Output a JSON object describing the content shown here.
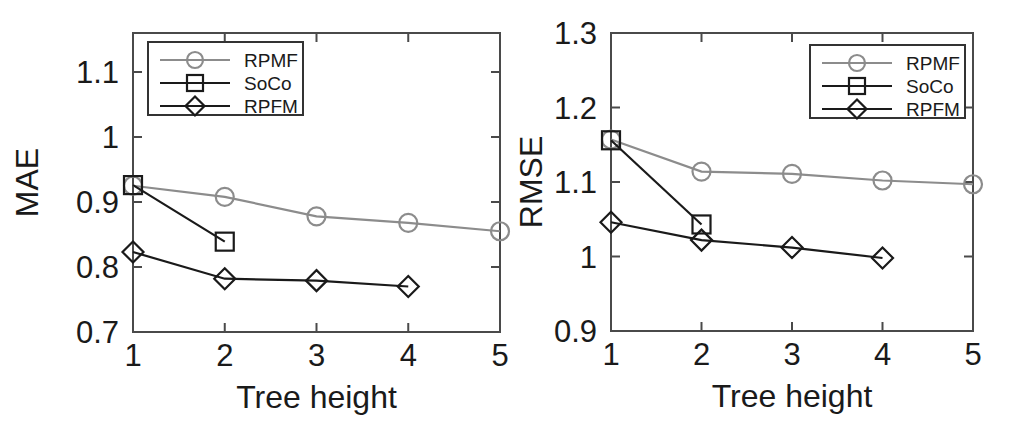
{
  "figure": {
    "background": "#ffffff",
    "panel_count": 2
  },
  "colors": {
    "rpmf": "#8c8c8c",
    "soco": "#1a1a1a",
    "rpfm": "#1a1a1a",
    "axis": "#4a4a4a",
    "text": "#1a1a1a",
    "legend_border": "#333333"
  },
  "legend": {
    "entries": [
      {
        "label": "RPMF",
        "marker": "circle",
        "color": "#8c8c8c"
      },
      {
        "label": "SoCo",
        "marker": "square",
        "color": "#1a1a1a"
      },
      {
        "label": "RPFM",
        "marker": "diamond",
        "color": "#1a1a1a"
      }
    ]
  },
  "chart_data": [
    {
      "id": "mae",
      "type": "line",
      "title": "",
      "xlabel": "Tree height",
      "ylabel": "MAE",
      "x": [
        1,
        2,
        3,
        4,
        5
      ],
      "xlim": [
        1,
        5
      ],
      "ylim": [
        0.7,
        1.16
      ],
      "xticks": [
        1,
        2,
        3,
        4,
        5
      ],
      "xticklabels": [
        "1",
        "2",
        "3",
        "4",
        "5"
      ],
      "yticks": [
        0.7,
        0.8,
        0.9,
        1.0,
        1.1
      ],
      "yticklabels": [
        "0.7",
        "0.8",
        "0.9",
        "1",
        "1.1"
      ],
      "grid": false,
      "legend_position": "upper left",
      "series": [
        {
          "name": "RPMF",
          "marker": "circle",
          "color": "#8c8c8c",
          "x": [
            1,
            2,
            3,
            4,
            5
          ],
          "values": [
            0.925,
            0.908,
            0.878,
            0.868,
            0.855
          ]
        },
        {
          "name": "SoCo",
          "marker": "square",
          "color": "#1a1a1a",
          "x": [
            1,
            2
          ],
          "values": [
            0.926,
            0.839
          ]
        },
        {
          "name": "RPFM",
          "marker": "diamond",
          "color": "#1a1a1a",
          "x": [
            1,
            2,
            3,
            4
          ],
          "values": [
            0.823,
            0.782,
            0.779,
            0.77
          ]
        }
      ]
    },
    {
      "id": "rmse",
      "type": "line",
      "title": "",
      "xlabel": "Tree height",
      "ylabel": "RMSE",
      "x": [
        1,
        2,
        3,
        4,
        5
      ],
      "xlim": [
        1,
        5
      ],
      "ylim": [
        0.9,
        1.3
      ],
      "xticks": [
        1,
        2,
        3,
        4,
        5
      ],
      "xticklabels": [
        "1",
        "2",
        "3",
        "4",
        "5"
      ],
      "yticks": [
        0.9,
        1.0,
        1.1,
        1.2,
        1.3
      ],
      "yticklabels": [
        "0.9",
        "1",
        "1.1",
        "1.2",
        "1.3"
      ],
      "grid": false,
      "legend_position": "upper right",
      "series": [
        {
          "name": "RPMF",
          "marker": "circle",
          "color": "#8c8c8c",
          "x": [
            1,
            2,
            3,
            4,
            5
          ],
          "values": [
            1.157,
            1.114,
            1.111,
            1.102,
            1.097
          ]
        },
        {
          "name": "SoCo",
          "marker": "square",
          "color": "#1a1a1a",
          "x": [
            1,
            2
          ],
          "values": [
            1.156,
            1.043
          ]
        },
        {
          "name": "RPFM",
          "marker": "diamond",
          "color": "#1a1a1a",
          "x": [
            1,
            2,
            3,
            4
          ],
          "values": [
            1.046,
            1.022,
            1.012,
            0.998
          ]
        }
      ]
    }
  ]
}
